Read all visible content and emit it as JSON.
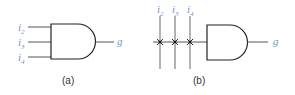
{
  "colors": {
    "wire": "#555555",
    "gate": "#222222",
    "label": "#6f93c8",
    "caption": "#333333"
  },
  "panels": [
    {
      "caption": "(a)",
      "inputs": [
        {
          "base": "i",
          "sub": "2"
        },
        {
          "base": "i",
          "sub": "3"
        },
        {
          "base": "i",
          "sub": "4"
        }
      ],
      "gate": "AND",
      "output": "g"
    },
    {
      "caption": "(b)",
      "inputs": [
        {
          "base": "i",
          "sub": "2"
        },
        {
          "base": "i",
          "sub": "3"
        },
        {
          "base": "i",
          "sub": "4"
        }
      ],
      "gate": "AND",
      "output": "g",
      "connections": "crosspoint"
    }
  ]
}
